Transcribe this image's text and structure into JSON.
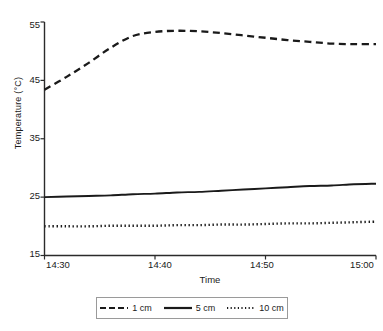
{
  "chart_data": {
    "type": "line",
    "title": "",
    "xlabel": "Time",
    "ylabel": "Temperature (°C)",
    "xtick_labels": [
      "14:30",
      "14:40",
      "14:50",
      "15:00"
    ],
    "ytick_labels": [
      "15",
      "25",
      "35",
      "45",
      "55"
    ],
    "ylim": [
      15,
      55
    ],
    "xlim": [
      "14:30",
      "15:00"
    ],
    "grid": false,
    "legend_position": "below-axis",
    "x": [
      "14:30",
      "14:32",
      "14:34",
      "14:36",
      "14:38",
      "14:40",
      "14:42",
      "14:44",
      "14:46",
      "14:48",
      "14:50",
      "14:52",
      "14:54",
      "14:56",
      "14:58",
      "15:00"
    ],
    "series": [
      {
        "name": "1 cm",
        "style": "dashed",
        "color": "#1a1a1a",
        "values": [
          43.4,
          45.6,
          48.0,
          50.6,
          52.6,
          53.3,
          53.5,
          53.4,
          53.1,
          52.7,
          52.3,
          51.9,
          51.6,
          51.3,
          51.2,
          51.2
        ]
      },
      {
        "name": "5 cm",
        "style": "solid",
        "color": "#1a1a1a",
        "values": [
          25.0,
          25.1,
          25.2,
          25.3,
          25.5,
          25.6,
          25.8,
          25.9,
          26.1,
          26.3,
          26.5,
          26.7,
          26.9,
          27.0,
          27.2,
          27.3
        ]
      },
      {
        "name": "10 cm",
        "style": "dotted",
        "color": "#1a1a1a",
        "values": [
          20.0,
          20.0,
          20.0,
          20.1,
          20.1,
          20.1,
          20.2,
          20.2,
          20.3,
          20.3,
          20.4,
          20.5,
          20.5,
          20.6,
          20.7,
          20.8
        ]
      }
    ]
  },
  "legend": {
    "entries": [
      {
        "label": "1 cm"
      },
      {
        "label": "5 cm"
      },
      {
        "label": "10 cm"
      }
    ]
  },
  "axes": {
    "ylabel": "Temperature (°C)",
    "xlabel": "Time",
    "yticks": [
      "55",
      "45",
      "35",
      "25",
      "15"
    ],
    "xticks": [
      "14:30",
      "14:40",
      "14:50",
      "15:00"
    ]
  }
}
